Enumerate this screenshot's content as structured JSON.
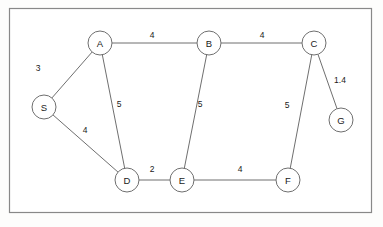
{
  "diagram": {
    "type": "graph",
    "frame": {
      "x": 9,
      "y": 8,
      "width": 363,
      "height": 205,
      "stroke": "#888888",
      "fill": "#ffffff"
    },
    "style": {
      "node_radius": 12,
      "node_stroke": "#6f6f6f",
      "edge_stroke": "#6f6f6f",
      "text_color": "#1a1a1a",
      "background": "#fdfdfc"
    },
    "nodes": [
      {
        "id": "S",
        "label": "S",
        "x": 44,
        "y": 107
      },
      {
        "id": "A",
        "label": "A",
        "x": 100,
        "y": 43
      },
      {
        "id": "B",
        "label": "B",
        "x": 209,
        "y": 43
      },
      {
        "id": "C",
        "label": "C",
        "x": 314,
        "y": 43
      },
      {
        "id": "D",
        "label": "D",
        "x": 127,
        "y": 180
      },
      {
        "id": "E",
        "label": "E",
        "x": 182,
        "y": 180
      },
      {
        "id": "F",
        "label": "F",
        "x": 288,
        "y": 180
      },
      {
        "id": "G",
        "label": "G",
        "x": 341,
        "y": 120
      }
    ],
    "edges": [
      {
        "from": "S",
        "to": "A",
        "weight": "3",
        "label_x": 38,
        "label_y": 68
      },
      {
        "from": "S",
        "to": "D",
        "weight": "4",
        "label_x": 85,
        "label_y": 130
      },
      {
        "from": "A",
        "to": "B",
        "weight": "4",
        "label_x": 152,
        "label_y": 35
      },
      {
        "from": "A",
        "to": "D",
        "weight": "5",
        "label_x": 119,
        "label_y": 104
      },
      {
        "from": "B",
        "to": "C",
        "weight": "4",
        "label_x": 262,
        "label_y": 35
      },
      {
        "from": "B",
        "to": "E",
        "weight": "5",
        "label_x": 200,
        "label_y": 104
      },
      {
        "from": "C",
        "to": "F",
        "weight": "5",
        "label_x": 287,
        "label_y": 105
      },
      {
        "from": "C",
        "to": "G",
        "weight": "1.4",
        "label_x": 340,
        "label_y": 80
      },
      {
        "from": "D",
        "to": "E",
        "weight": "2",
        "label_x": 152,
        "label_y": 169
      },
      {
        "from": "E",
        "to": "F",
        "weight": "4",
        "label_x": 240,
        "label_y": 169
      }
    ]
  }
}
